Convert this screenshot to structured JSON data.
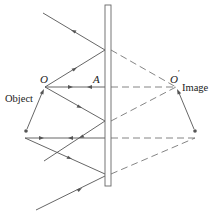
{
  "diagram": {
    "type": "plane-mirror-ray-diagram",
    "labels": {
      "object_point": "O",
      "image_point": "O",
      "image_prime": "′",
      "mirror_point": "A",
      "object": "Object",
      "image": "Image"
    },
    "colors": {
      "line": "#555555",
      "mirror_fill": "#ffffff",
      "mirror_stroke": "#666666",
      "text": "#222222"
    }
  }
}
